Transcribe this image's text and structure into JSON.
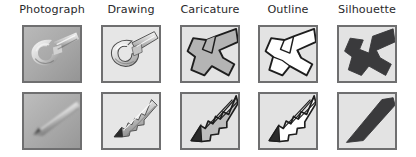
{
  "figure": {
    "title": "",
    "columns": [
      {
        "label": "Photograph",
        "style": "photograph"
      },
      {
        "label": "Drawing",
        "style": "drawing"
      },
      {
        "label": "Caricature",
        "style": "caricature"
      },
      {
        "label": "Outline",
        "style": "outline"
      },
      {
        "label": "Silhouette",
        "style": "silhouette"
      }
    ],
    "rows": [
      {
        "object": "wrench",
        "cells": [
          "wrench-photograph",
          "wrench-drawing",
          "wrench-caricature",
          "wrench-outline",
          "wrench-silhouette"
        ]
      },
      {
        "object": "pencil",
        "cells": [
          "pencil-photograph",
          "pencil-drawing",
          "pencil-caricature",
          "pencil-outline",
          "pencil-silhouette"
        ]
      }
    ],
    "colors": {
      "cell_background": "#dcdcdc",
      "cell_border": "#6f6f70",
      "label_text": "#29292b",
      "silhouette_fill": "#3a3a3c",
      "outline_fill": "#ffffff",
      "outline_stroke": "#1e1e1e",
      "caricature_fill": "#b4b4b4",
      "page_background": "#ffffff"
    },
    "layout": {
      "columns_count": 5,
      "rows_count": 2,
      "cell_width_px": 60,
      "cell_height_px": 58,
      "column_left_px": [
        22,
        101,
        180,
        258,
        337
      ],
      "row_top_px": [
        25,
        92
      ]
    }
  }
}
